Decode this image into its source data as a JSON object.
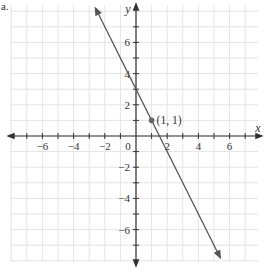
{
  "problem_label": "a.",
  "chart_data": {
    "type": "line",
    "title": "",
    "xlabel": "x",
    "ylabel": "y",
    "xlim": [
      -8,
      8
    ],
    "ylim": [
      -8,
      8
    ],
    "grid": true,
    "x_ticks": [
      -6,
      -4,
      -2,
      2,
      4,
      6
    ],
    "y_ticks": [
      -6,
      -4,
      -2,
      2,
      4,
      6
    ],
    "origin_label": "0",
    "series": [
      {
        "name": "y = -2x + 3",
        "slope": -2,
        "intercept": 3,
        "x": [
          -2.6,
          5.4
        ],
        "values": [
          8.2,
          -7.8
        ],
        "arrows_both_ends": true,
        "color": "#555555"
      }
    ],
    "annotations": [
      {
        "type": "point",
        "x": 1,
        "y": 1,
        "label": "(1, 1)",
        "color": "#666666"
      }
    ]
  },
  "colors": {
    "grid": "#e3e3e3",
    "axis": "#333333",
    "line": "#555555",
    "text": "#333333"
  }
}
